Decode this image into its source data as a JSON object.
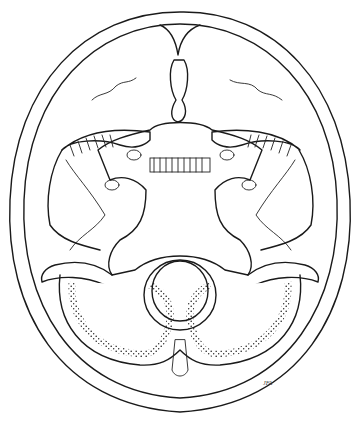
{
  "image": {
    "subject": "Line illustration of the interior base of the skull viewed from above",
    "style": "pen and ink with stipple shading",
    "colors": {
      "ink": "#1a1a1a",
      "background": "#ffffff"
    },
    "signature": "JFA"
  }
}
